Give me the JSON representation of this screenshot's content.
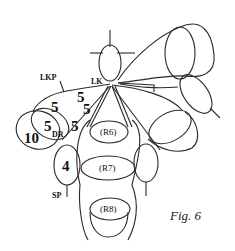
{
  "figure": {
    "caption": "Fig. 6",
    "labels": {
      "lkp": "LKP",
      "lk": "LK",
      "dr": "DR",
      "sp": "SP"
    },
    "numbers": {
      "n_upper_left": "5",
      "n_upper_mid_a": "5",
      "n_upper_mid_b": "5",
      "n_dr": "5",
      "n_right_of_dr": "5",
      "n_ten": "10",
      "n_four": "4"
    },
    "regions": {
      "r6": "(R6)",
      "r7": "(R7)",
      "r8": "(R8)"
    }
  }
}
